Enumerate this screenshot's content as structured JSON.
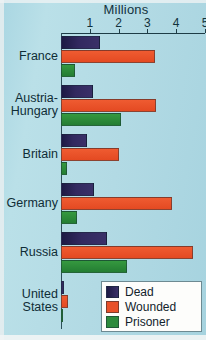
{
  "chart_data": {
    "type": "bar",
    "orientation": "horizontal",
    "title": "Millions",
    "xlabel": "Millions",
    "ylabel": "",
    "xlim": [
      0,
      5
    ],
    "xticks": [
      1,
      2,
      3,
      4,
      5
    ],
    "xtick_labels": [
      "1",
      "2",
      "3",
      "4",
      "5"
    ],
    "grid": false,
    "legend_position": "bottom-right",
    "categories": [
      "France",
      "Austria-Hungary",
      "Britain",
      "Germany",
      "Russia",
      "United States"
    ],
    "series": [
      {
        "name": "Dead",
        "color": "#2b2459",
        "values": [
          1.35,
          1.1,
          0.9,
          1.15,
          1.6,
          0.12
        ]
      },
      {
        "name": "Wounded",
        "color": "#e8512a",
        "values": [
          3.25,
          3.3,
          2.0,
          3.85,
          4.6,
          0.23
        ]
      },
      {
        "name": "Prisoner",
        "color": "#2d8b3d",
        "values": [
          0.5,
          2.1,
          0.2,
          0.55,
          2.3,
          0.05
        ]
      }
    ]
  },
  "axis": {
    "title": "Millions",
    "tick_labels": [
      "1",
      "2",
      "3",
      "4",
      "5"
    ]
  },
  "categories": [
    {
      "label": "France",
      "line1": "France",
      "line2": ""
    },
    {
      "label": "Austria-Hungary",
      "line1": "Austria-",
      "line2": "Hungary"
    },
    {
      "label": "Britain",
      "line1": "Britain",
      "line2": ""
    },
    {
      "label": "Germany",
      "line1": "Germany",
      "line2": ""
    },
    {
      "label": "Russia",
      "line1": "Russia",
      "line2": ""
    },
    {
      "label": "United States",
      "line1": "United",
      "line2": "States"
    }
  ],
  "legend": {
    "items": [
      {
        "label": "Dead",
        "color": "#2b2459"
      },
      {
        "label": "Wounded",
        "color": "#e8512a"
      },
      {
        "label": "Prisoner",
        "color": "#2d8b3d"
      }
    ]
  },
  "colors": {
    "background": "#b4dce6",
    "axis": "#1d3c46",
    "dead": "#2b2459",
    "wounded": "#e8512a",
    "prisoner": "#2d8b3d",
    "legend_background": "#fdfdfb"
  }
}
